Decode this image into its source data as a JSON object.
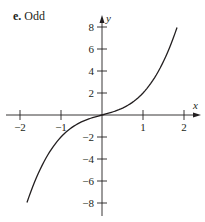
{
  "panel": {
    "letter": "e.",
    "title": "Odd"
  },
  "chart_data": {
    "type": "line",
    "title": "e. Odd",
    "xlabel": "x",
    "ylabel": "y",
    "xlim": [
      -2.2,
      2.2
    ],
    "ylim": [
      -8.5,
      8.5
    ],
    "x_ticks": [
      -2,
      -1,
      1,
      2
    ],
    "x_tick_labels": [
      "−2",
      "−1",
      "1",
      "2"
    ],
    "y_ticks": [
      8,
      6,
      4,
      2,
      -2,
      -4,
      -6,
      -8
    ],
    "y_tick_labels": [
      "8",
      "6",
      "4",
      "2",
      "−2",
      "−4",
      "−6",
      "−8"
    ],
    "grid": false,
    "legend": false,
    "series": [
      {
        "name": "odd function",
        "x": [
          -1.83,
          -1.5,
          -1.25,
          -1.0,
          -0.75,
          -0.5,
          -0.25,
          0,
          0.25,
          0.5,
          0.75,
          1.0,
          1.25,
          1.5,
          1.83
        ],
        "y": [
          -7.96,
          -4.88,
          -3.2,
          -2.0,
          -1.17,
          -0.63,
          -0.27,
          0,
          0.27,
          0.63,
          1.17,
          2.0,
          3.2,
          4.88,
          7.96
        ]
      }
    ],
    "color": "#231f20"
  }
}
